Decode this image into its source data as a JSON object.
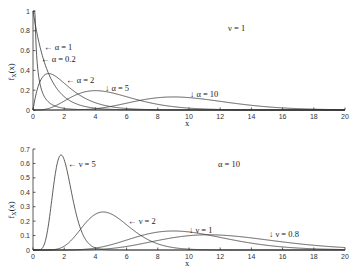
{
  "chart_data": [
    {
      "type": "line",
      "title": "",
      "annotation": "ν = 1",
      "xlabel": "x",
      "ylabel": "f_X(x)",
      "xlim": [
        0,
        20
      ],
      "ylim": [
        0,
        1
      ],
      "xticks": [
        0,
        2,
        4,
        6,
        8,
        10,
        12,
        14,
        16,
        18,
        20
      ],
      "yticks": [
        0,
        0.2,
        0.4,
        0.6,
        0.8,
        1
      ],
      "grid": false,
      "distribution": "gamma pdf f(x)=ν^α x^(α-1) e^(-νx)/Γ(α)",
      "series": [
        {
          "name": "α = 0.2",
          "alpha": 0.2,
          "nu": 1,
          "label": "← α = 0.2"
        },
        {
          "name": "α = 1",
          "alpha": 1,
          "nu": 1,
          "label": "← α = 1"
        },
        {
          "name": "α = 2",
          "alpha": 2,
          "nu": 1,
          "label": "← α = 2"
        },
        {
          "name": "α = 5",
          "alpha": 5,
          "nu": 1,
          "label": "↓ α = 5"
        },
        {
          "name": "α = 10",
          "alpha": 10,
          "nu": 1,
          "label": "↓ α = 10"
        }
      ],
      "peaks": [
        {
          "name": "α = 2",
          "x": 1,
          "y": 0.37
        },
        {
          "name": "α = 5",
          "x": 4,
          "y": 0.2
        },
        {
          "name": "α = 10",
          "x": 9,
          "y": 0.13
        }
      ]
    },
    {
      "type": "line",
      "title": "",
      "annotation": "α = 10",
      "xlabel": "x",
      "ylabel": "f_X(x)",
      "xlim": [
        0,
        20
      ],
      "ylim": [
        0,
        0.7
      ],
      "xticks": [
        0,
        2,
        4,
        6,
        8,
        10,
        12,
        14,
        16,
        18,
        20
      ],
      "yticks": [
        0,
        0.1,
        0.2,
        0.3,
        0.4,
        0.5,
        0.6,
        0.7
      ],
      "grid": false,
      "distribution": "gamma pdf f(x)=ν^α x^(α-1) e^(-νx)/Γ(α)",
      "series": [
        {
          "name": "ν = 5",
          "alpha": 10,
          "nu": 5,
          "label": "← ν = 5"
        },
        {
          "name": "ν = 2",
          "alpha": 10,
          "nu": 2,
          "label": "← ν = 2"
        },
        {
          "name": "ν = 1",
          "alpha": 10,
          "nu": 1,
          "label": "↓ ν = 1"
        },
        {
          "name": "ν = 0.8",
          "alpha": 10,
          "nu": 0.8,
          "label": "↓ ν = 0.8"
        }
      ],
      "peaks": [
        {
          "name": "ν = 5",
          "x": 1.8,
          "y": 0.66
        },
        {
          "name": "ν = 2",
          "x": 4.5,
          "y": 0.26
        },
        {
          "name": "ν = 1",
          "x": 9,
          "y": 0.13
        },
        {
          "name": "ν = 0.8",
          "x": 11.25,
          "y": 0.1
        }
      ]
    }
  ],
  "labels": {
    "top_annotation": "ν = 1",
    "bottom_annotation": "α = 10",
    "xlabel": "x",
    "ylabel_main": "f",
    "ylabel_sub": "X",
    "ylabel_arg": "(x)",
    "top_series_labels": [
      "← α = 1",
      "← α = 0.2",
      "← α = 2",
      "↓ α = 5",
      "↓ α = 10"
    ],
    "bottom_series_labels": [
      "← ν = 5",
      "← ν = 2",
      "↓ ν = 1",
      "↓ ν = 0.8"
    ]
  }
}
